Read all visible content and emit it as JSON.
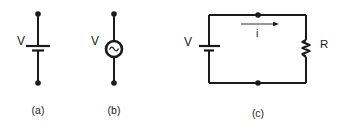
{
  "diagram": {
    "type": "electric circuit schematics",
    "panels": [
      {
        "id": "a",
        "caption": "(a)",
        "source_label": "V",
        "source_type": "DC battery"
      },
      {
        "id": "b",
        "caption": "(b)",
        "source_label": "V",
        "source_type": "AC source"
      },
      {
        "id": "c",
        "caption": "(c)",
        "source_label": "V",
        "current_label": "i",
        "resistor_label": "R",
        "source_type": "DC battery"
      }
    ],
    "colors": {
      "stroke": "#1a1a1a",
      "background": "#ffffff"
    }
  }
}
